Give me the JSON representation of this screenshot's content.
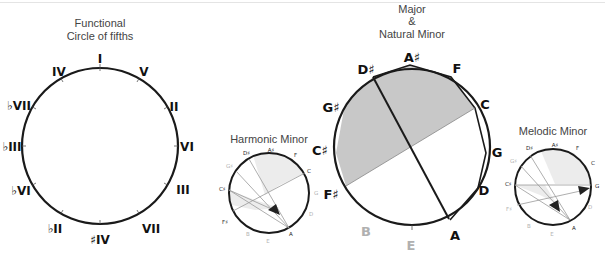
{
  "functional": {
    "title_line1": "Functional",
    "title_line2": "Circle of fifths",
    "labels": [
      "I",
      "V",
      "II",
      "VI",
      "III",
      "VII",
      "♯IV",
      "♭II",
      "♭VI",
      "♭III",
      "♭VII",
      "IV"
    ]
  },
  "harmonic": {
    "title": "Harmonic Minor",
    "labels": [
      "A♯",
      "F",
      "C",
      "G",
      "D",
      "A",
      "E",
      "B",
      "F♯",
      "C♯",
      "G♯",
      "D♯"
    ]
  },
  "major": {
    "title_line1": "Major",
    "title_line2": "&",
    "title_line3": "Natural Minor",
    "labels": [
      "A♯",
      "F",
      "C",
      "G",
      "D",
      "A",
      "E",
      "B",
      "F♯",
      "C♯",
      "G♯",
      "D♯"
    ]
  },
  "melodic": {
    "title": "Melodic Minor",
    "labels": [
      "A♯",
      "F",
      "C",
      "G",
      "D",
      "A",
      "E",
      "B",
      "F♯",
      "C♯",
      "G♯",
      "D♯"
    ]
  },
  "colors": {
    "shade": "#c8c8c8",
    "light_shade": "#ececec",
    "stroke": "#1a1a1a",
    "faint_label": "#b0b0b0"
  }
}
